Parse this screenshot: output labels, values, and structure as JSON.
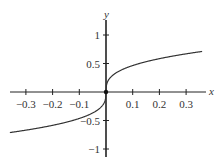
{
  "chart_data": {
    "type": "line",
    "title": "",
    "xlabel": "x",
    "ylabel": "y",
    "xlim": [
      -0.36,
      0.36
    ],
    "ylim": [
      -1.1,
      1.2
    ],
    "grid": false,
    "legend": null,
    "x_ticks": [
      -0.3,
      -0.2,
      -0.1,
      0.1,
      0.2,
      0.3
    ],
    "x_tick_labels": [
      "−0.3",
      "−0.2",
      "−0.1",
      "0.1",
      "0.2",
      "0.3"
    ],
    "y_ticks": [
      1,
      0.5,
      -0.5,
      -1
    ],
    "y_tick_labels": [
      "1",
      "0.5",
      "−0.5",
      "−1"
    ],
    "series": [
      {
        "name": "y = x^(1/3)",
        "x": [
          -0.36,
          -0.3,
          -0.2,
          -0.1,
          -0.05,
          -0.01,
          0,
          0.01,
          0.05,
          0.1,
          0.2,
          0.3,
          0.36
        ],
        "y": [
          -0.711,
          -0.669,
          -0.585,
          -0.464,
          -0.368,
          -0.215,
          0,
          0.215,
          0.368,
          0.464,
          0.585,
          0.669,
          0.711
        ]
      }
    ],
    "annotations": [
      {
        "type": "point",
        "x": 0,
        "y": 0
      }
    ]
  },
  "colors": {
    "axis": "#222222",
    "curve": "#333333",
    "text": "#333333"
  }
}
